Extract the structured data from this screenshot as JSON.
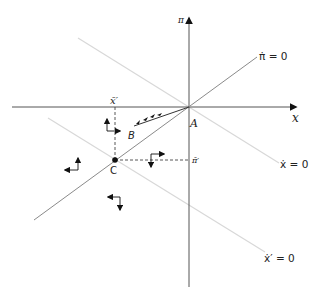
{
  "diagram": {
    "axes": {
      "horizontal_label": "x",
      "vertical_label": "π"
    },
    "lines": {
      "pi_dot_zero": "π̇ = 0",
      "x_dot_zero": "ẋ = 0",
      "x_prime_dot_zero": "ẋ′ = 0"
    },
    "points": {
      "A": "A",
      "B": "B",
      "C": "C"
    },
    "dashed_labels": {
      "x_bar_prime": "x̄′",
      "pi_bar_prime": "π̄′"
    },
    "colors": {
      "axis": "#555555",
      "pi_dot_line": "#8a8a8a",
      "light_lines": "#d8d8d8",
      "arrows": "#111111"
    },
    "direction_arrows": [
      {
        "region": "upper-left of C",
        "horizontal": "right",
        "vertical": "up"
      },
      {
        "region": "far left",
        "horizontal": "left",
        "vertical": "up"
      },
      {
        "region": "right of C",
        "horizontal": "right",
        "vertical": "down"
      },
      {
        "region": "below C",
        "horizontal": "left",
        "vertical": "down"
      }
    ]
  }
}
